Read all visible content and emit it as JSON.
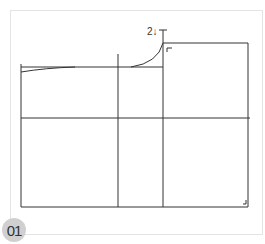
{
  "figure": {
    "step_number": "01",
    "annotation": "2↓",
    "colors": {
      "line": "#333333",
      "frame": "#e4e4e4",
      "badge_bg": "#d0d0d0"
    }
  }
}
